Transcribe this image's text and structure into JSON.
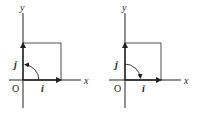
{
  "diagrams": [
    {
      "id": "left",
      "axis_x_label": "x",
      "axis_y_label": "y",
      "origin_label": "O",
      "vector_i_label": "i",
      "vector_j_label": "j",
      "rotation": "counterclockwise (i to j)"
    },
    {
      "id": "right",
      "axis_x_label": "x",
      "axis_y_label": "y",
      "origin_label": "O",
      "vector_i_label": "i",
      "vector_j_label": "j",
      "rotation": "clockwise (j to i)"
    }
  ],
  "colors": {
    "ink": "#222222",
    "background": "#ffffff"
  }
}
